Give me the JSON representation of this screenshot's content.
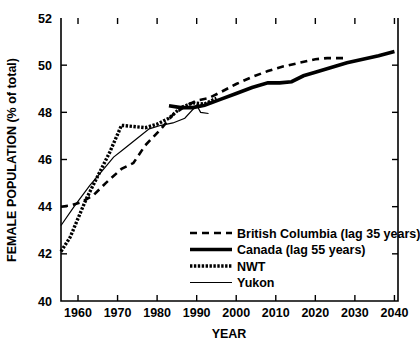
{
  "chart_data": {
    "type": "line",
    "title": "",
    "xlabel": "YEAR",
    "ylabel": "FEMALE POPULATION (% of total)",
    "xlim": [
      1955.7,
      2040.9
    ],
    "ylim": [
      40,
      52
    ],
    "xticks": [
      1960,
      1970,
      1980,
      1990,
      2000,
      2010,
      2020,
      2030,
      2040
    ],
    "yticks": [
      40,
      42,
      44,
      46,
      48,
      50,
      52
    ],
    "grid": false,
    "legend_position": "inside-lower-right",
    "series": [
      {
        "name": "British Columbia (lag 35 years)",
        "style": "dashed",
        "x": [
          1955.7,
          1958,
          1961,
          1964,
          1967,
          1971,
          1974,
          1977,
          1981,
          1984,
          1987,
          1990,
          1993,
          1996,
          2000,
          2004,
          2008,
          2012,
          2016,
          2020,
          2023,
          2026,
          2027
        ],
        "y": [
          44.0,
          44.05,
          44.2,
          44.5,
          45.0,
          45.6,
          45.85,
          46.6,
          47.3,
          47.9,
          48.25,
          48.5,
          48.6,
          48.85,
          49.2,
          49.5,
          49.75,
          49.95,
          50.1,
          50.25,
          50.3,
          50.3,
          50.3
        ]
      },
      {
        "name": "Canada (lag 55 years)",
        "style": "thick",
        "x": [
          1983,
          1986,
          1989,
          1992,
          1996,
          2000,
          2004,
          2008,
          2011,
          2014,
          2017,
          2020,
          2024,
          2028,
          2032,
          2036,
          2040
        ],
        "y": [
          48.28,
          48.2,
          48.2,
          48.3,
          48.55,
          48.8,
          49.05,
          49.25,
          49.25,
          49.3,
          49.55,
          49.7,
          49.9,
          50.1,
          50.25,
          50.4,
          50.58
        ]
      },
      {
        "name": "NWT",
        "style": "hatched",
        "x": [
          1955.7,
          1958,
          1962,
          1965,
          1968,
          1971,
          1974,
          1977,
          1980,
          1983,
          1986,
          1989,
          1992,
          1995
        ],
        "y": [
          42.1,
          42.7,
          44.3,
          45.3,
          46.3,
          47.45,
          47.4,
          47.35,
          47.5,
          47.75,
          48.2,
          48.4,
          48.35,
          48.6
        ]
      },
      {
        "name": "Yukon",
        "style": "thin",
        "x": [
          1955.7,
          1959,
          1963,
          1966,
          1969,
          1972,
          1975,
          1978,
          1981,
          1984,
          1987,
          1990,
          1991,
          1993
        ],
        "y": [
          43.2,
          44.0,
          44.9,
          45.5,
          46.1,
          46.5,
          46.9,
          47.3,
          47.45,
          47.55,
          47.75,
          48.3,
          48.0,
          47.95
        ]
      }
    ]
  },
  "legend": {
    "items": [
      {
        "label": "British Columbia (lag 35 years)",
        "style": "dashed"
      },
      {
        "label": "Canada (lag 55 years)",
        "style": "thick"
      },
      {
        "label": "NWT",
        "style": "hatched"
      },
      {
        "label": "Yukon",
        "style": "thin"
      }
    ]
  },
  "colors": {
    "ink": "#000000",
    "background": "#ffffff"
  }
}
